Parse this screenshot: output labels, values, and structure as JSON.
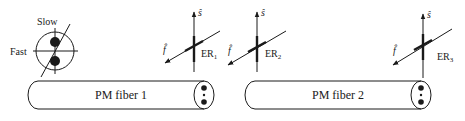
{
  "diagram": {
    "colors": {
      "ink": "#1a1a1a",
      "background": "#ffffff"
    },
    "axis_legend": {
      "slow_label": "Slow",
      "fast_label": "Fast"
    },
    "fibers": [
      {
        "label": "PM fiber 1"
      },
      {
        "label": "PM fiber 2"
      }
    ],
    "axes": [
      {
        "s_label": "ŝ",
        "f_label": "f̂",
        "er_label": "ER",
        "er_sub": "1"
      },
      {
        "s_label": "ŝ",
        "f_label": "f̂",
        "er_label": "ER",
        "er_sub": "2"
      },
      {
        "s_label": "ŝ",
        "f_label": "f̂",
        "er_label": "ER",
        "er_sub": "3"
      }
    ]
  }
}
